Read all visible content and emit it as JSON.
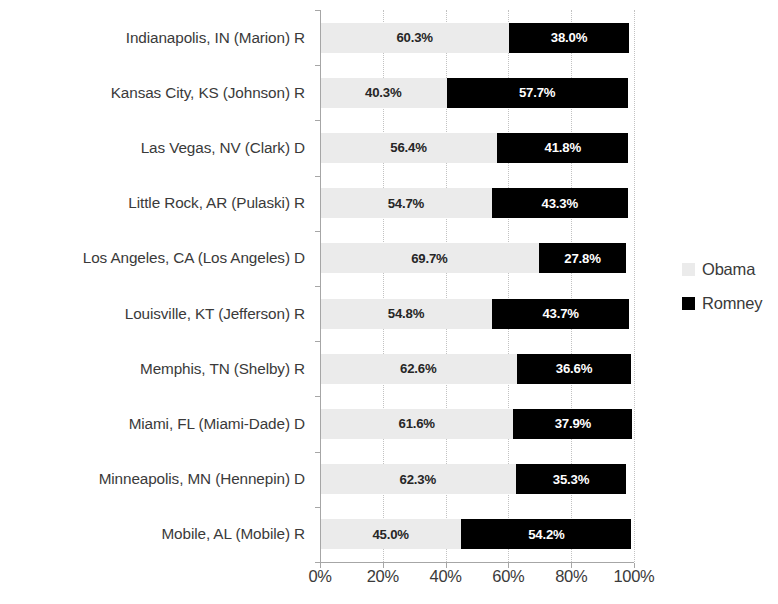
{
  "chart_data": {
    "type": "bar",
    "subtype": "horizontal-stacked-bar",
    "title": "",
    "xlabel": "",
    "ylabel": "",
    "xlim": [
      0,
      100
    ],
    "xticks": [
      "0%",
      "20%",
      "40%",
      "60%",
      "80%",
      "100%"
    ],
    "xtick_values": [
      0,
      20,
      40,
      60,
      80,
      100
    ],
    "grid": "vertical-dotted",
    "legend_position": "right",
    "categories": [
      "Indianapolis, IN (Marion) R",
      "Kansas City, KS (Johnson) R",
      "Las Vegas, NV (Clark) D",
      "Little Rock, AR (Pulaski) R",
      "Los Angeles, CA (Los Angeles) D",
      "Louisville, KT (Jefferson) R",
      "Memphis, TN (Shelby) R",
      "Miami, FL (Miami-Dade) D",
      "Minneapolis, MN (Hennepin) D",
      "Mobile, AL (Mobile) R"
    ],
    "series": [
      {
        "name": "Obama",
        "color": "#ebebeb",
        "values": [
          60.3,
          40.3,
          56.4,
          54.7,
          69.7,
          54.8,
          62.6,
          61.6,
          62.3,
          45.0
        ],
        "labels": [
          "60.3%",
          "40.3%",
          "56.4%",
          "54.7%",
          "69.7%",
          "54.8%",
          "62.6%",
          "61.6%",
          "62.3%",
          "45.0%"
        ]
      },
      {
        "name": "Romney",
        "color": "#000000",
        "values": [
          38.0,
          57.7,
          41.8,
          43.3,
          27.8,
          43.7,
          36.6,
          37.9,
          35.3,
          54.2
        ],
        "labels": [
          "38.0%",
          "57.7%",
          "41.8%",
          "43.3%",
          "27.8%",
          "43.7%",
          "36.6%",
          "37.9%",
          "35.3%",
          "54.2%"
        ]
      }
    ]
  },
  "legend": {
    "items": [
      {
        "label": "Obama",
        "color": "#ebebeb",
        "swatch_name": "legend-swatch-obama"
      },
      {
        "label": "Romney",
        "color": "#000000",
        "swatch_name": "legend-swatch-romney"
      }
    ]
  },
  "axis": {
    "x_tick_labels": [
      "0%",
      "20%",
      "40%",
      "60%",
      "80%",
      "100%"
    ]
  }
}
